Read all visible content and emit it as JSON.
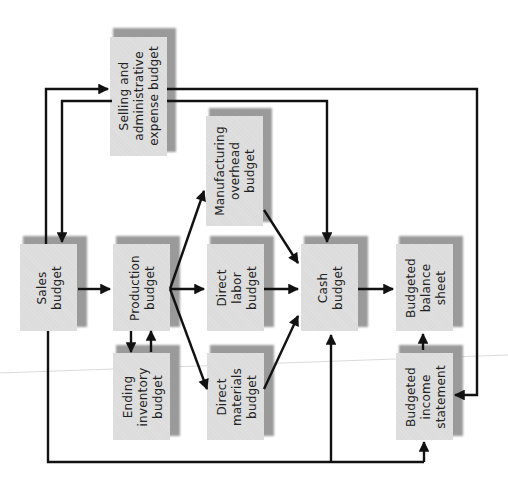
{
  "diagram": {
    "colors": {
      "box_face": "#dcdcdc",
      "box_shadow": "#9a9a9a",
      "arrow": "#111111",
      "text": "#222222"
    },
    "nodes": {
      "sales": {
        "label": "Sales\nbudget"
      },
      "production": {
        "label": "Production\nbudget"
      },
      "direct_labor": {
        "label": "Direct\nlabor\nbudget"
      },
      "cash": {
        "label": "Cash\nbudget"
      },
      "balance_sheet": {
        "label": "Budgeted\nbalance\nsheet"
      },
      "ending_inventory": {
        "label": "Ending\ninventory\nbudget"
      },
      "direct_materials": {
        "label": "Direct\nmaterials\nbudget"
      },
      "income_statement": {
        "label": "Budgeted\nincome\nstatement"
      },
      "selling_admin": {
        "label": "Selling and\nadministrative\nexpense budget"
      },
      "manufacturing_overhead": {
        "label": "Manufacturing\noverhead\nbudget"
      }
    },
    "edges": [
      {
        "from": "Sales budget",
        "to": "Production budget"
      },
      {
        "from": "Sales budget",
        "to": "Selling and administrative expense budget"
      },
      {
        "from": "Selling and administrative expense budget",
        "to": "Sales budget"
      },
      {
        "from": "Sales budget",
        "to": "Cash budget"
      },
      {
        "from": "Sales budget",
        "to": "Budgeted income statement"
      },
      {
        "from": "Production budget",
        "to": "Ending inventory budget"
      },
      {
        "from": "Ending inventory budget",
        "to": "Production budget"
      },
      {
        "from": "Production budget",
        "to": "Direct labor budget"
      },
      {
        "from": "Production budget",
        "to": "Direct materials budget"
      },
      {
        "from": "Production budget",
        "to": "Manufacturing overhead budget"
      },
      {
        "from": "Direct labor budget",
        "to": "Cash budget"
      },
      {
        "from": "Direct materials budget",
        "to": "Cash budget"
      },
      {
        "from": "Manufacturing overhead budget",
        "to": "Cash budget"
      },
      {
        "from": "Selling and administrative expense budget",
        "to": "Cash budget"
      },
      {
        "from": "Selling and administrative expense budget",
        "to": "Budgeted income statement"
      },
      {
        "from": "Cash budget",
        "to": "Budgeted balance sheet"
      },
      {
        "from": "Budgeted income statement",
        "to": "Budgeted balance sheet"
      }
    ]
  }
}
